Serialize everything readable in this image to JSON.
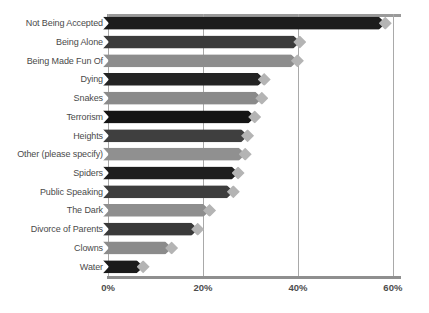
{
  "chart_data": {
    "type": "bar",
    "orientation": "horizontal",
    "title": "",
    "subtitle": "",
    "xlabel": "",
    "ylabel": "",
    "xlim": [
      0,
      61.5
    ],
    "grid": true,
    "legend": false,
    "x_tick_labels": [
      "0%",
      "20%",
      "40%",
      "60%"
    ],
    "x_ticks": [
      0,
      20,
      40,
      60
    ],
    "categories": [
      "Not Being Accepted",
      "Being Alone",
      "Being Made Fun Of",
      "Dying",
      "Snakes",
      "Terrorism",
      "Heights",
      "Other (please specify)",
      "Spiders",
      "Public Speaking",
      "The Dark",
      "Divorce of Parents",
      "Clowns",
      "Water"
    ],
    "values": [
      58.5,
      40.5,
      40.0,
      33.0,
      32.5,
      31.0,
      29.5,
      29.0,
      27.5,
      26.5,
      21.5,
      19.0,
      13.5,
      7.5
    ],
    "bar_colors": [
      "#1c1c1c",
      "#3b3b3b",
      "#8d8d8d",
      "#242424",
      "#8a8a8a",
      "#141414",
      "#3f3f3f",
      "#909090",
      "#1e1e1e",
      "#3d3d3d",
      "#8e8e8e",
      "#3a3a3a",
      "#8b8b8b",
      "#1b1b1b"
    ],
    "tip_color": "#b4b4b4",
    "gridline_color": "#a9a9a9",
    "axis_color": "#8f8f8f",
    "label_color": "#4a4a4a",
    "background": "#ffffff"
  }
}
